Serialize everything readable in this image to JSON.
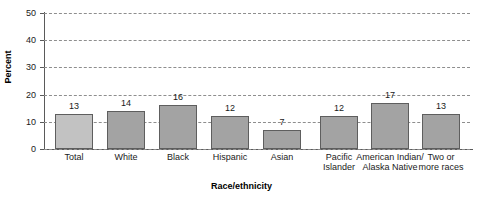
{
  "chart_data": {
    "type": "bar",
    "title": "",
    "subtitle": "",
    "xlabel": "Race/ethnicity",
    "ylabel": "Percent",
    "ylim": [
      0,
      50
    ],
    "yticks": [
      0,
      10,
      20,
      30,
      40,
      50
    ],
    "grid": true,
    "legend": "none",
    "categories": [
      "Total",
      "White",
      "Black",
      "Hispanic",
      "Asian",
      "Pacific\nIslander",
      "American Indian/\nAlaska Native",
      "Two or\nmore races"
    ],
    "values": [
      13,
      14,
      16,
      12,
      7,
      12,
      17,
      13
    ],
    "value_labels": [
      "13",
      "14",
      "16",
      "12",
      "7",
      "12",
      "17",
      "13"
    ]
  },
  "axis": {
    "y_title": "Percent",
    "x_title": "Race/ethnicity",
    "y_tick_labels": [
      "50",
      "40",
      "30",
      "20",
      "10",
      "0"
    ]
  },
  "colors": {
    "bar_fill": "#a3a3a3",
    "bar_fill_first": "#c2c2c2",
    "bar_border": "#5e5e5e",
    "gridline": "#8e8e8e",
    "axis_line": "#5a5a5a",
    "text": "#1a1a1a",
    "background": "#ffffff"
  }
}
